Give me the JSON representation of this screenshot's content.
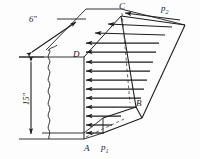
{
  "figure": {
    "type": "engineering-diagram",
    "stroke_color": "#1d1d1d",
    "background_color": "#fdfdfd",
    "dimensions": {
      "thickness": {
        "label": "6″",
        "value": 6,
        "unit": "in",
        "orientation": "diagonal-depth"
      },
      "height": {
        "label": "15″",
        "value": 15,
        "unit": "in",
        "orientation": "vertical"
      }
    },
    "points": [
      {
        "id": "A",
        "label": "A",
        "x": 84,
        "y": 143,
        "desc": "bottom-front-left corner of wall face"
      },
      {
        "id": "B",
        "label": "B",
        "x": 136,
        "y": 104,
        "desc": "interior vertex of pressure prism"
      },
      {
        "id": "C",
        "label": "C",
        "x": 121,
        "y": 8,
        "desc": "top-front-right corner of wall face"
      },
      {
        "id": "D",
        "label": "D",
        "x": 76,
        "y": 55,
        "desc": "top-front-left corner of wall face"
      }
    ],
    "pressures": [
      {
        "id": "p1",
        "base": "p",
        "subscript": "1",
        "x": 104,
        "y": 143,
        "desc": "pressure at bottom edge"
      },
      {
        "id": "p2",
        "base": "p",
        "subscript": "2",
        "x": 164,
        "y": 6,
        "desc": "pressure at top edge"
      }
    ],
    "arrows": {
      "direction": "leftward",
      "meaning": "pressure vectors acting on the wall face",
      "front_face_count": 10,
      "top_face_count": 3,
      "total_count": 13
    },
    "features": [
      {
        "name": "break-line",
        "desc": "wavy cut-away line on left side of wall"
      },
      {
        "name": "dashed-centerline",
        "desc": "vertical dashed line from C downward"
      },
      {
        "name": "dashed-edge",
        "desc": "dashed hidden edge near A"
      }
    ]
  }
}
